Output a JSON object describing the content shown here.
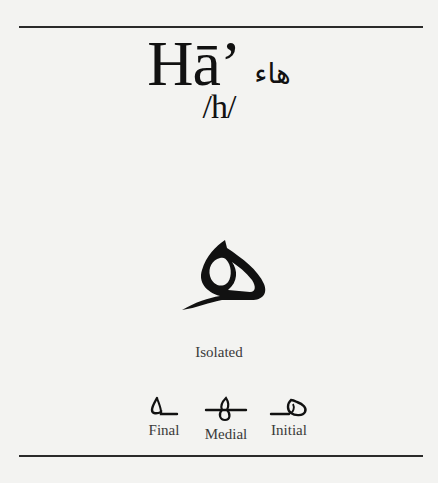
{
  "letter": {
    "name_latin": "Hā’",
    "name_arabic": "هاء",
    "phoneme": "/h/"
  },
  "isolated": {
    "glyph": "ه",
    "label": "Isolated"
  },
  "forms": [
    {
      "label": "Final",
      "glyph": "ـه"
    },
    {
      "label": "Medial",
      "glyph": "ـهـ"
    },
    {
      "label": "Initial",
      "glyph": "هـ"
    }
  ],
  "colors": {
    "background": "#f3f3f1",
    "ink": "#111111",
    "rule": "#2a2a2a",
    "label": "#3a3a3a"
  }
}
